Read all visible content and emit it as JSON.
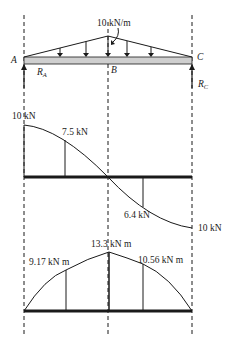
{
  "beam": {
    "load_label": "10 kN/m",
    "point_a": "A",
    "point_b": "B",
    "point_c": "C",
    "reaction_a": {
      "base": "R",
      "sub": "A"
    },
    "reaction_c": {
      "base": "R",
      "sub": "C"
    }
  },
  "shear_diagram": {
    "labels": [
      "10 kN",
      "7.5 kN",
      "6.4 kN",
      "10 kN"
    ]
  },
  "moment_diagram": {
    "labels": [
      "9.17 kN m",
      "13.3 kN m",
      "10.56 kN m"
    ]
  },
  "colors": {
    "line": "#1a1a1a",
    "beam_fill": "#cfcfcf"
  }
}
